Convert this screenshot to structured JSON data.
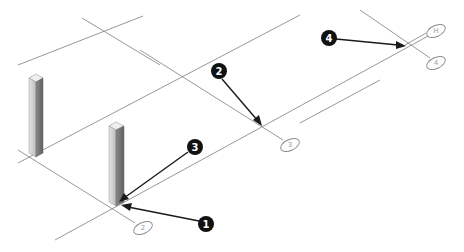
{
  "diagram": {
    "type": "isometric-grid-with-columns",
    "grid_bubbles": [
      {
        "label": "H",
        "x": 436,
        "y": 31
      },
      {
        "label": "4",
        "x": 436,
        "y": 63
      },
      {
        "label": "3",
        "x": 290,
        "y": 145
      },
      {
        "label": "2",
        "x": 143,
        "y": 228
      }
    ],
    "callouts": [
      {
        "number": "1",
        "x": 206,
        "y": 224
      },
      {
        "number": "2",
        "x": 219,
        "y": 71
      },
      {
        "number": "3",
        "x": 195,
        "y": 147
      },
      {
        "number": "4",
        "x": 329,
        "y": 38
      }
    ],
    "columns": [
      {
        "name": "column-left",
        "x": 36,
        "top": 75,
        "bottom": 157
      },
      {
        "name": "column-center",
        "x": 116,
        "top": 124,
        "bottom": 205
      }
    ],
    "colors": {
      "grid_line": "#8c8c8c",
      "callout_fill": "#111111",
      "callout_text": "#ffffff",
      "column_light": "#d8d8d8",
      "column_dark": "#7a7a7a"
    }
  }
}
